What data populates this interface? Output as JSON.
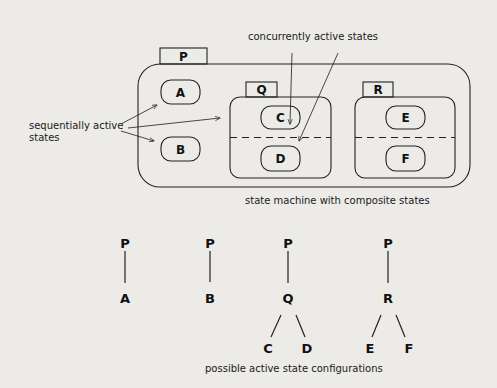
{
  "diagram": {
    "top": {
      "caption": "state machine with composite states",
      "annotations": {
        "concurrent": "concurrently active states",
        "sequential_line1": "sequentially active",
        "sequential_line2": "states"
      },
      "composite_state": {
        "name": "P",
        "substates": [
          {
            "name": "A",
            "type": "simple"
          },
          {
            "name": "B",
            "type": "simple"
          },
          {
            "name": "Q",
            "type": "concurrent",
            "regions": [
              [
                "C"
              ],
              [
                "D"
              ]
            ]
          },
          {
            "name": "R",
            "type": "concurrent",
            "regions": [
              [
                "E"
              ],
              [
                "F"
              ]
            ]
          }
        ]
      }
    },
    "bottom": {
      "caption": "possible active state configurations",
      "configurations": [
        {
          "root": "P",
          "child": "A",
          "leaves": []
        },
        {
          "root": "P",
          "child": "B",
          "leaves": []
        },
        {
          "root": "P",
          "child": "Q",
          "leaves": [
            "C",
            "D"
          ]
        },
        {
          "root": "P",
          "child": "R",
          "leaves": [
            "E",
            "F"
          ]
        }
      ]
    }
  }
}
